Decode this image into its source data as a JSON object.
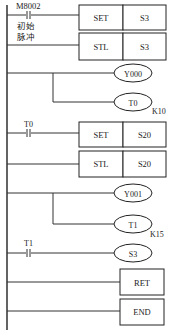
{
  "diagram": {
    "type": "PLC ladder diagram (SFC step ladder)",
    "left_rail": {
      "x": 7,
      "y1": 5,
      "y2": 330
    },
    "rungs": [
      {
        "id": "rung-1",
        "y": 15,
        "contact": {
          "label": "M8002",
          "note_line1": "初始",
          "note_line2": "脉冲",
          "x": 27
        },
        "instruction": {
          "op": "SET",
          "operand": "S3"
        }
      },
      {
        "id": "rung-2",
        "y": 45,
        "instruction": {
          "op": "STL",
          "operand": "S3"
        }
      },
      {
        "id": "rung-3",
        "y": 73,
        "coil": {
          "label": "Y000"
        }
      },
      {
        "id": "rung-4",
        "y": 102,
        "coil": {
          "label": "T0",
          "preset": "K10"
        },
        "branch_from_x": 53
      },
      {
        "id": "rung-5",
        "y": 133,
        "contact": {
          "label": "T0",
          "x": 27
        },
        "instruction": {
          "op": "SET",
          "operand": "S20"
        }
      },
      {
        "id": "rung-6",
        "y": 164,
        "instruction": {
          "op": "STL",
          "operand": "S20"
        }
      },
      {
        "id": "rung-7",
        "y": 193,
        "coil": {
          "label": "Y001"
        }
      },
      {
        "id": "rung-8",
        "y": 222,
        "coil": {
          "label": "T1",
          "preset": "K15"
        },
        "branch_from_x": 53
      },
      {
        "id": "rung-9",
        "y": 251,
        "contact": {
          "label": "T1",
          "x": 27
        },
        "coil": {
          "label": "S3"
        }
      },
      {
        "id": "rung-10",
        "y": 279,
        "instruction": {
          "op": "RET"
        }
      },
      {
        "id": "rung-11",
        "y": 311,
        "instruction": {
          "op": "END"
        }
      }
    ],
    "labels": {
      "m8002": "M8002",
      "init_1": "初始",
      "init_2": "脉冲",
      "set": "SET",
      "stl": "STL",
      "s3": "S3",
      "s20": "S20",
      "y000": "Y000",
      "y001": "Y001",
      "t0": "T0",
      "t1": "T1",
      "k10": "K10",
      "k15": "K15",
      "ret": "RET",
      "end": "END"
    }
  }
}
